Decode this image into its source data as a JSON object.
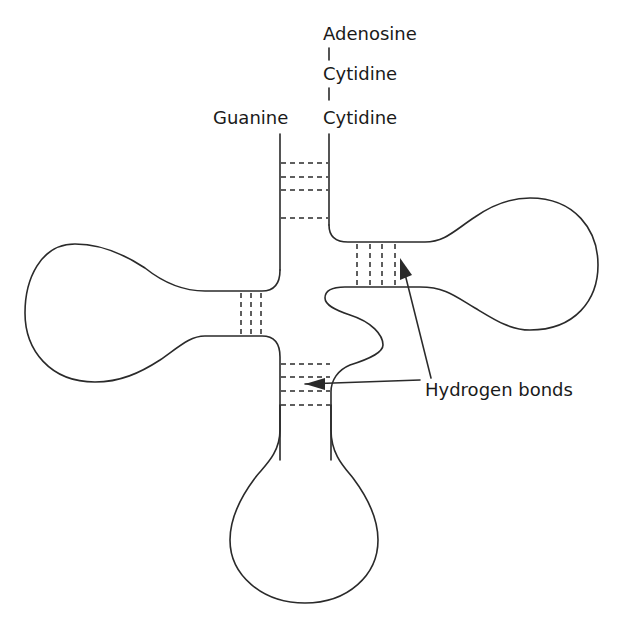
{
  "diagram": {
    "labels": {
      "adenosine": "Adenosine",
      "cytidine_1": "Cytidine",
      "cytidine_2": "Cytidine",
      "guanine": "Guanine",
      "hydrogen_bonds": "Hydrogen bonds"
    },
    "connector": "|",
    "colors": {
      "line": "#2a2a2a",
      "text": "#1a1a1a",
      "background": "#ffffff"
    }
  }
}
